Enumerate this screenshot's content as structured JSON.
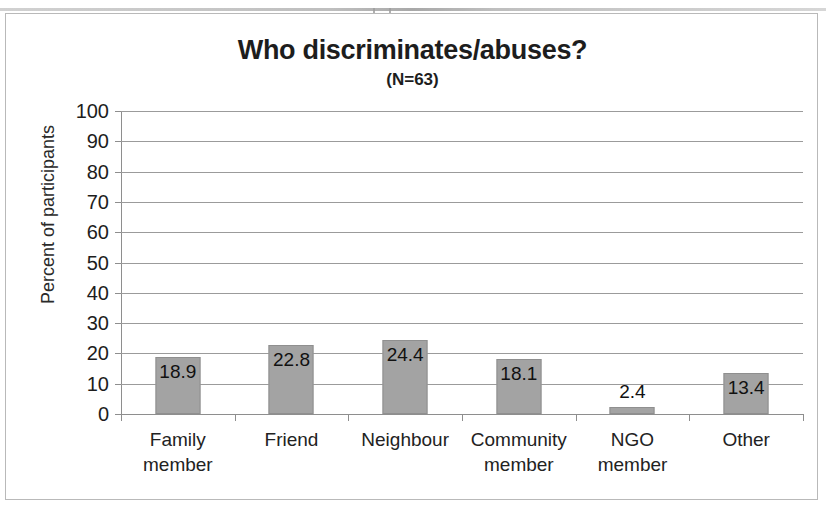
{
  "chart_data": {
    "type": "bar",
    "title": "Who discriminates/abuses?",
    "subtitle": "(N=63)",
    "categories": [
      "Family\nmember",
      "Friend",
      "Neighbour",
      "Community\nmember",
      "NGO\nmember",
      "Other"
    ],
    "values": [
      18.9,
      22.8,
      24.4,
      18.1,
      2.4,
      13.4
    ],
    "value_labels": [
      "18.9",
      "22.8",
      "24.4",
      "18.1",
      "2.4",
      "13.4"
    ],
    "xlabel": "",
    "ylabel": "Percent of participants",
    "ylim": [
      0,
      100
    ],
    "ytick_step": 10,
    "ytick_labels": [
      "100",
      "90",
      "80",
      "70",
      "60",
      "50",
      "40",
      "30",
      "20",
      "10",
      "0"
    ],
    "grid": true,
    "legend": false,
    "bar_color": "#a3a3a3",
    "bar_border_color": "#8f8f8f",
    "gridline_color": "#9b9b9b",
    "axis_color": "#8e8e8e",
    "text_color": "#1d1d1d"
  }
}
